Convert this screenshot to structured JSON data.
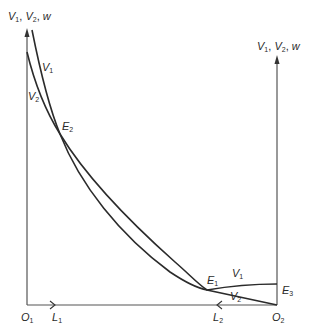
{
  "diagram": {
    "type": "two-sector labor allocation (Edgeworth-style box) diagram",
    "colors": {
      "line": "#2b2b2b",
      "axis": "#555555",
      "background": "#ffffff"
    },
    "left_axis": {
      "label_base": [
        "V",
        "V",
        "w"
      ],
      "label_subs": [
        "1",
        "2",
        ""
      ],
      "origin_label": "O",
      "origin_sub": "1"
    },
    "right_axis": {
      "label_base": [
        "V",
        "V",
        "w"
      ],
      "label_subs": [
        "1",
        "2",
        ""
      ],
      "origin_label": "O",
      "origin_sub": "2"
    },
    "horizontal_axis": {
      "L1": {
        "base": "L",
        "sub": "1",
        "arrow_direction": "right"
      },
      "L2": {
        "base": "L",
        "sub": "2",
        "arrow_direction": "left"
      }
    },
    "curves": [
      {
        "name": "V1",
        "base": "V",
        "sub": "1",
        "description": "steep at O1 axis, flatter near O2; ends at E3 on right axis"
      },
      {
        "name": "V2",
        "base": "V",
        "sub": "2",
        "description": "starts lower on O1 axis; ends at O2"
      }
    ],
    "points": [
      {
        "name": "E2",
        "base": "E",
        "sub": "2",
        "description": "upper intersection of V1 and V2"
      },
      {
        "name": "E1",
        "base": "E",
        "sub": "1",
        "description": "lower intersection of V1 and V2"
      },
      {
        "name": "E3",
        "base": "E",
        "sub": "3",
        "description": "V1 meets right axis"
      }
    ],
    "curve_labels": {
      "v1_top": {
        "base": "V",
        "sub": "1"
      },
      "v2_top": {
        "base": "V",
        "sub": "2"
      },
      "v1_bottom": {
        "base": "V",
        "sub": "1"
      },
      "v2_bottom": {
        "base": "V",
        "sub": "2"
      }
    },
    "separator": ", "
  }
}
